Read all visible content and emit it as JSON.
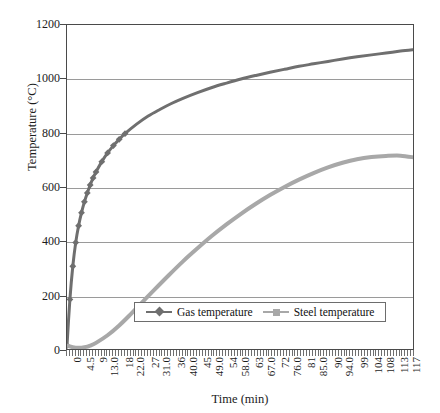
{
  "chart_data": {
    "type": "line",
    "title": "",
    "xlabel": "Time (min)",
    "ylabel": "Temperature (°C)",
    "xlim": [
      0,
      120
    ],
    "ylim": [
      0,
      1200
    ],
    "grid": true,
    "legend_position": "inside-bottom-center",
    "y_ticks": [
      0,
      200,
      400,
      600,
      800,
      1000,
      1200
    ],
    "y_tick_labels": [
      "0",
      "200",
      "400",
      "600",
      "800",
      "1000",
      "1200"
    ],
    "x_tick_labels": [
      "0",
      "4.5",
      "9",
      "13.0",
      "18",
      "22.0",
      "27",
      "31.0",
      "36",
      "40.0",
      "45",
      "49.0",
      "54",
      "58.0",
      "63",
      "67.0",
      "72",
      "76.0",
      "81",
      "85.0",
      "90",
      "94.0",
      "99",
      "104",
      "108",
      "113",
      "117"
    ],
    "x_tick_values": [
      0,
      4.5,
      9,
      13,
      18,
      22,
      27,
      31,
      36,
      40,
      45,
      49,
      54,
      58,
      63,
      67,
      72,
      76,
      81,
      85,
      90,
      94,
      99,
      104,
      108,
      113,
      117
    ],
    "series": [
      {
        "name": "Gas temperature",
        "color": "#6f6f6f",
        "marker": "diamond",
        "x": [
          0,
          1,
          2,
          3,
          4,
          5,
          6,
          7,
          8,
          9,
          10,
          12,
          14,
          16,
          18,
          20,
          24,
          28,
          32,
          36,
          40,
          45,
          50,
          55,
          60,
          65,
          70,
          75,
          80,
          85,
          90,
          95,
          100,
          105,
          110,
          115,
          120
        ],
        "y": [
          20,
          190,
          312,
          399,
          461,
          509,
          549,
          582,
          611,
          637,
          659,
          697,
          729,
          756,
          779,
          800,
          835,
          865,
          889,
          911,
          930,
          951,
          970,
          986,
          1001,
          1014,
          1026,
          1037,
          1048,
          1057,
          1066,
          1075,
          1083,
          1090,
          1097,
          1104,
          1110
        ]
      },
      {
        "name": "Steel temperature",
        "color": "#a8a8a8",
        "marker": "square",
        "x": [
          0,
          2,
          4,
          6,
          8,
          10,
          14,
          18,
          22,
          26,
          30,
          35,
          40,
          45,
          50,
          55,
          60,
          65,
          70,
          75,
          80,
          85,
          90,
          95,
          100,
          105,
          110,
          115,
          120
        ],
        "y": [
          20,
          14,
          12,
          14,
          20,
          30,
          58,
          94,
          136,
          180,
          224,
          278,
          330,
          378,
          424,
          466,
          505,
          541,
          574,
          604,
          631,
          655,
          676,
          693,
          706,
          714,
          718,
          719,
          712
        ]
      }
    ]
  },
  "legend": {
    "entries": [
      {
        "label": "Gas temperature"
      },
      {
        "label": "Steel temperature"
      }
    ]
  }
}
